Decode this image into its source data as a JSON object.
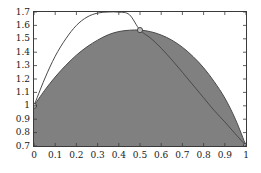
{
  "chart_data": {
    "type": "line",
    "title": "",
    "xlabel": "",
    "ylabel": "",
    "xlim": [
      0,
      1
    ],
    "ylim": [
      0.7,
      1.7
    ],
    "grid": false,
    "legend": "none",
    "xticks": [
      "0",
      "0.1",
      "0.2",
      "0.3",
      "0.4",
      "0.5",
      "0.6",
      "0.7",
      "0.8",
      "0.9",
      "1"
    ],
    "xtick_values": [
      0,
      0.1,
      0.2,
      0.3,
      0.4,
      0.5,
      0.6,
      0.7,
      0.8,
      0.9,
      1
    ],
    "yticks": [
      "0.7",
      "0.8",
      "0.9",
      "1",
      "1.1",
      "1.2",
      "1.3",
      "1.4",
      "1.5",
      "1.6",
      "1.7"
    ],
    "ytick_values": [
      0.7,
      0.8,
      0.9,
      1.0,
      1.1,
      1.2,
      1.3,
      1.4,
      1.5,
      1.6,
      1.7
    ],
    "fill_color": "#808080",
    "line_color": "#4a4a4a",
    "marker_face_color": "#bdbdbd",
    "marker_edge_color": "#3a3a3a",
    "series": [
      {
        "name": "filled-area-curve",
        "style": "area",
        "fill": true,
        "x": [
          0.0,
          0.05,
          0.1,
          0.15,
          0.2,
          0.25,
          0.3,
          0.35,
          0.4,
          0.45,
          0.5,
          0.55,
          0.6,
          0.65,
          0.7,
          0.75,
          0.8,
          0.85,
          0.9,
          0.95,
          1.0
        ],
        "values": [
          1.0,
          1.115,
          1.215,
          1.302,
          1.378,
          1.44,
          1.49,
          1.53,
          1.554,
          1.564,
          1.565,
          1.553,
          1.528,
          1.49,
          1.437,
          1.368,
          1.284,
          1.18,
          1.058,
          0.9,
          0.702
        ]
      },
      {
        "name": "outline-curve",
        "style": "line",
        "fill": false,
        "x": [
          0.0,
          0.05,
          0.1,
          0.15,
          0.2,
          0.25,
          0.3,
          0.35,
          0.4,
          0.45,
          0.5,
          0.55,
          0.6,
          0.65,
          0.7,
          0.75,
          0.8,
          0.85,
          0.9,
          0.95,
          1.0
        ],
        "values": [
          1.0,
          1.2,
          1.37,
          1.5,
          1.6,
          1.662,
          1.692,
          1.7,
          1.699,
          1.68,
          1.565,
          1.505,
          1.43,
          1.343,
          1.25,
          1.155,
          1.06,
          0.965,
          0.88,
          0.79,
          0.702
        ]
      }
    ],
    "markers": [
      {
        "name": "marker-start",
        "x": 0,
        "y": 1.0
      },
      {
        "name": "marker-peak",
        "x": 0.5,
        "y": 1.565
      },
      {
        "name": "marker-end",
        "x": 1,
        "y": 0.702
      }
    ]
  }
}
